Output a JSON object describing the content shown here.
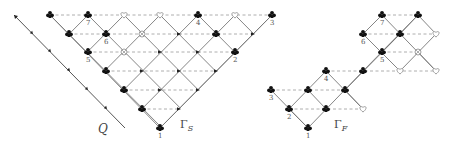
{
  "diagram": {
    "colors": {
      "edge": "#777777",
      "dash": "#999999",
      "node": "#111111",
      "open": "#888888"
    },
    "q_line": {
      "label": "Q",
      "from": [
        14,
        15
      ],
      "to": [
        125,
        128
      ],
      "arrow_points": [
        [
          33,
          34
        ],
        [
          51,
          52
        ],
        [
          70,
          71
        ],
        [
          88,
          90
        ],
        [
          107,
          109
        ]
      ]
    },
    "gamma_s": {
      "label": "Γ",
      "sub": "S",
      "label_pos": [
        180,
        128
      ],
      "triangle": {
        "left": [
          50,
          15
        ],
        "right": [
          272,
          15
        ],
        "bottom": [
          160,
          128
        ]
      },
      "rows_y": [
        15,
        34,
        52,
        71,
        90,
        109,
        128
      ],
      "dashes": [
        {
          "y": 15,
          "x1": 50,
          "x2": 272
        },
        {
          "y": 34,
          "x1": 69,
          "x2": 253
        },
        {
          "y": 52,
          "x1": 88,
          "x2": 235
        },
        {
          "y": 71,
          "x1": 106,
          "x2": 216
        },
        {
          "y": 90,
          "x1": 124,
          "x2": 198
        },
        {
          "y": 109,
          "x1": 142,
          "x2": 179
        }
      ],
      "nodes": [
        {
          "x": 50,
          "y": 15,
          "type": "club"
        },
        {
          "x": 88,
          "y": 15,
          "type": "club",
          "label": "7"
        },
        {
          "x": 124,
          "y": 15,
          "type": "heart"
        },
        {
          "x": 160,
          "y": 15,
          "type": "heart"
        },
        {
          "x": 198,
          "y": 15,
          "type": "club",
          "label": "4"
        },
        {
          "x": 235,
          "y": 15,
          "type": "heart"
        },
        {
          "x": 272,
          "y": 15,
          "type": "club",
          "label": "3"
        },
        {
          "x": 69,
          "y": 34,
          "type": "club"
        },
        {
          "x": 106,
          "y": 34,
          "type": "club",
          "label": "6"
        },
        {
          "x": 142,
          "y": 34,
          "type": "crossed"
        },
        {
          "x": 179,
          "y": 34,
          "type": "arrow"
        },
        {
          "x": 216,
          "y": 34,
          "type": "club"
        },
        {
          "x": 253,
          "y": 34,
          "type": "arrow"
        },
        {
          "x": 88,
          "y": 52,
          "type": "club",
          "label": "5"
        },
        {
          "x": 124,
          "y": 52,
          "type": "crossed"
        },
        {
          "x": 160,
          "y": 52,
          "type": "arrow"
        },
        {
          "x": 198,
          "y": 52,
          "type": "arrow"
        },
        {
          "x": 235,
          "y": 52,
          "type": "club",
          "label": "2"
        },
        {
          "x": 106,
          "y": 71,
          "type": "club"
        },
        {
          "x": 142,
          "y": 71,
          "type": "arrow"
        },
        {
          "x": 179,
          "y": 71,
          "type": "arrow"
        },
        {
          "x": 216,
          "y": 71,
          "type": "arrow"
        },
        {
          "x": 124,
          "y": 90,
          "type": "club"
        },
        {
          "x": 160,
          "y": 90,
          "type": "arrow"
        },
        {
          "x": 198,
          "y": 90,
          "type": "arrow"
        },
        {
          "x": 142,
          "y": 109,
          "type": "club"
        },
        {
          "x": 179,
          "y": 109,
          "type": "arrow"
        },
        {
          "x": 160,
          "y": 128,
          "type": "club",
          "label": "1"
        }
      ]
    },
    "gamma_f": {
      "label": "Γ",
      "sub": "F",
      "label_pos": [
        334,
        128
      ],
      "edges": [
        [
          [
            271,
            90
          ],
          [
            308,
            128
          ]
        ],
        [
          [
            289,
            109
          ],
          [
            326,
            71
          ]
        ],
        [
          [
            308,
            128
          ],
          [
            363,
            71
          ]
        ],
        [
          [
            326,
            71
          ],
          [
            363,
            109
          ]
        ],
        [
          [
            289,
            109
          ],
          [
            308,
            128
          ]
        ],
        [
          [
            308,
            90
          ],
          [
            326,
            109
          ]
        ],
        [
          [
            345,
            90
          ],
          [
            400,
            34
          ]
        ],
        [
          [
            345,
            90
          ],
          [
            363,
            109
          ]
        ],
        [
          [
            363,
            71
          ],
          [
            418,
            15
          ]
        ],
        [
          [
            363,
            34
          ],
          [
            400,
            71
          ]
        ],
        [
          [
            382,
            15
          ],
          [
            436,
            71
          ]
        ],
        [
          [
            400,
            34
          ],
          [
            418,
            15
          ]
        ],
        [
          [
            382,
            52
          ],
          [
            400,
            34
          ]
        ],
        [
          [
            418,
            15
          ],
          [
            436,
            34
          ]
        ],
        [
          [
            400,
            71
          ],
          [
            436,
            34
          ]
        ],
        [
          [
            418,
            52
          ],
          [
            436,
            71
          ]
        ],
        [
          [
            363,
            34
          ],
          [
            382,
            15
          ]
        ]
      ],
      "dashes": [
        {
          "y": 15,
          "x1": 382,
          "x2": 418
        },
        {
          "y": 34,
          "x1": 363,
          "x2": 436
        },
        {
          "y": 52,
          "x1": 382,
          "x2": 418
        },
        {
          "y": 71,
          "x1": 326,
          "x2": 436
        },
        {
          "y": 90,
          "x1": 271,
          "x2": 345
        },
        {
          "y": 109,
          "x1": 289,
          "x2": 363
        }
      ],
      "nodes": [
        {
          "x": 382,
          "y": 15,
          "type": "club",
          "label": "7"
        },
        {
          "x": 418,
          "y": 15,
          "type": "club"
        },
        {
          "x": 363,
          "y": 34,
          "type": "club",
          "label": "6"
        },
        {
          "x": 400,
          "y": 34,
          "type": "club"
        },
        {
          "x": 436,
          "y": 34,
          "type": "heart"
        },
        {
          "x": 382,
          "y": 52,
          "type": "club",
          "label": "5"
        },
        {
          "x": 418,
          "y": 52,
          "type": "crossed"
        },
        {
          "x": 326,
          "y": 71,
          "type": "club",
          "label": "4"
        },
        {
          "x": 363,
          "y": 71,
          "type": "club"
        },
        {
          "x": 400,
          "y": 71,
          "type": "heart"
        },
        {
          "x": 436,
          "y": 71,
          "type": "heart"
        },
        {
          "x": 271,
          "y": 90,
          "type": "club",
          "label": "3"
        },
        {
          "x": 308,
          "y": 90,
          "type": "club"
        },
        {
          "x": 345,
          "y": 90,
          "type": "club"
        },
        {
          "x": 289,
          "y": 109,
          "type": "club",
          "label": "2"
        },
        {
          "x": 326,
          "y": 109,
          "type": "club"
        },
        {
          "x": 363,
          "y": 109,
          "type": "heart"
        },
        {
          "x": 308,
          "y": 128,
          "type": "club",
          "label": "1"
        }
      ]
    }
  }
}
